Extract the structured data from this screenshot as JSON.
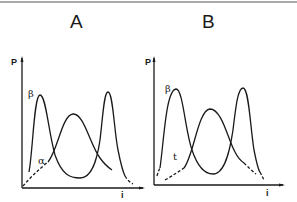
{
  "panels": [
    {
      "title": "A",
      "y_axis_label": "P",
      "x_axis_label": "i",
      "curve_labels": [
        "β",
        "α"
      ]
    },
    {
      "title": "B",
      "y_axis_label": "P",
      "x_axis_label": "i",
      "curve_labels": [
        "β",
        "t"
      ]
    }
  ],
  "colors": {
    "ink": "#1a1a1a",
    "background": "#ffffff"
  }
}
